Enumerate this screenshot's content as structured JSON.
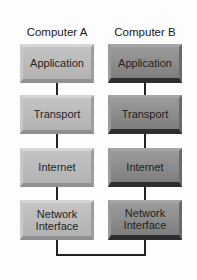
{
  "columns": [
    {
      "title": "Computer A",
      "layers": [
        "Application",
        "Transport",
        "Internet",
        "Network Interface"
      ]
    },
    {
      "title": "Computer B",
      "layers": [
        "Application",
        "Transport",
        "Internet",
        "Network Interface"
      ]
    }
  ],
  "colors": {
    "computer_a_box": "#b9b9b9",
    "computer_b_box": "#8d8d8d",
    "line": "#222222"
  }
}
